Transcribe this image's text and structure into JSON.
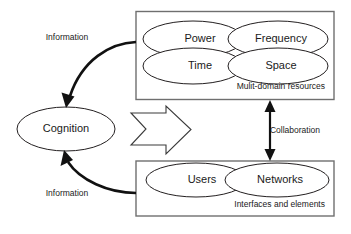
{
  "diagram": {
    "colors": {
      "background": "#ffffff",
      "shape_stroke": "#231f20",
      "box_stroke": "#6f6f6f",
      "arrow": "#111111",
      "text": "#1a1a1a"
    },
    "cognition_node": {
      "label": "Cognition"
    },
    "top_group": {
      "caption": "Mulit-domain resources",
      "nodes": [
        {
          "label": "Power"
        },
        {
          "label": "Frequency"
        },
        {
          "label": "Time"
        },
        {
          "label": "Space"
        }
      ]
    },
    "bottom_group": {
      "caption": "Interfaces and elements",
      "nodes": [
        {
          "label": "Users"
        },
        {
          "label": "Networks"
        }
      ]
    },
    "edges": {
      "top_information_label": "Information",
      "bottom_information_label": "Information",
      "collaboration_label": "Collaboration"
    }
  }
}
